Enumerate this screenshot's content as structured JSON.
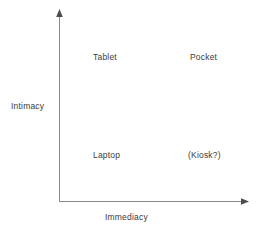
{
  "diagram": {
    "type": "two-axis-quadrant-matrix",
    "background_color": "#ffffff",
    "axis_color": "#8a8a8a",
    "text_color": "#3a3a3a",
    "axes": {
      "x": {
        "label": "Immediacy",
        "direction": "increasing-right",
        "has_arrowhead": true
      },
      "y": {
        "label": "Intimacy",
        "direction": "increasing-up",
        "has_arrowhead": true
      }
    },
    "quadrants": [
      {
        "id": "top-left",
        "label": "Tablet",
        "x_level": "low",
        "y_level": "high"
      },
      {
        "id": "top-right",
        "label": "Pocket",
        "x_level": "high",
        "y_level": "high"
      },
      {
        "id": "bottom-left",
        "label": "Laptop",
        "x_level": "low",
        "y_level": "low"
      },
      {
        "id": "bottom-right",
        "label": "(Kiosk?)",
        "x_level": "high",
        "y_level": "low"
      }
    ]
  }
}
